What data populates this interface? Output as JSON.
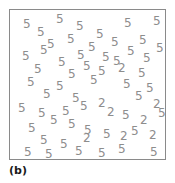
{
  "figure": {
    "label": "(b)",
    "border_color": "#8a8a8a",
    "background_color": "#ffffff",
    "glyph_color": "#8d8d8d",
    "frame": {
      "x": 9,
      "y": 9,
      "width": 157,
      "height": 151
    }
  },
  "chart_data": {
    "type": "scatter",
    "title": "(b)",
    "subtitle": "",
    "xlabel": "",
    "ylabel": "",
    "xlim": [
      0,
      157
    ],
    "ylim": [
      0,
      151
    ],
    "grid": false,
    "legend": "none",
    "counts": {
      "5": 51,
      "2": 9,
      "total": 60
    },
    "categories": [
      "5",
      "2"
    ],
    "values": [
      51,
      9
    ],
    "points": [
      {
        "label": "5",
        "x": 13,
        "y": 8,
        "rot": 0
      },
      {
        "label": "5",
        "x": 27,
        "y": 16,
        "rot": 0
      },
      {
        "label": "5",
        "x": 46,
        "y": 3,
        "rot": 0
      },
      {
        "label": "5",
        "x": 66,
        "y": 10,
        "rot": 0
      },
      {
        "label": "5",
        "x": 86,
        "y": 18,
        "rot": 0
      },
      {
        "label": "5",
        "x": 114,
        "y": 7,
        "rot": 0
      },
      {
        "label": "5",
        "x": 143,
        "y": 5,
        "rot": 0
      },
      {
        "label": "5",
        "x": 37,
        "y": 28,
        "rot": 0
      },
      {
        "label": "5",
        "x": 57,
        "y": 23,
        "rot": 0
      },
      {
        "label": "5",
        "x": 78,
        "y": 31,
        "rot": 0
      },
      {
        "label": "5",
        "x": 101,
        "y": 26,
        "rot": 0
      },
      {
        "label": "5",
        "x": 129,
        "y": 24,
        "rot": 0
      },
      {
        "label": "5",
        "x": 12,
        "y": 40,
        "rot": 0
      },
      {
        "label": "5",
        "x": 30,
        "y": 34,
        "rot": 0
      },
      {
        "label": "5",
        "x": 67,
        "y": 39,
        "rot": 0
      },
      {
        "label": "5",
        "x": 92,
        "y": 41,
        "rot": 0
      },
      {
        "label": "5",
        "x": 117,
        "y": 35,
        "rot": 0
      },
      {
        "label": "5",
        "x": 146,
        "y": 32,
        "rot": 0
      },
      {
        "label": "5",
        "x": 48,
        "y": 46,
        "rot": 0
      },
      {
        "label": "5",
        "x": 73,
        "y": 50,
        "rot": 0
      },
      {
        "label": "5",
        "x": 103,
        "y": 45,
        "rot": 0
      },
      {
        "label": "5",
        "x": 133,
        "y": 42,
        "rot": 0
      },
      {
        "label": "5",
        "x": 24,
        "y": 53,
        "rot": 0
      },
      {
        "label": "5",
        "x": 58,
        "y": 58,
        "rot": 0
      },
      {
        "label": "5",
        "x": 88,
        "y": 55,
        "rot": 0
      },
      {
        "label": "2",
        "x": 108,
        "y": 52,
        "rot": 0
      },
      {
        "label": "5",
        "x": 128,
        "y": 57,
        "rot": 0
      },
      {
        "label": "5",
        "x": 17,
        "y": 66,
        "rot": 0
      },
      {
        "label": "5",
        "x": 46,
        "y": 70,
        "rot": 0
      },
      {
        "label": "5",
        "x": 80,
        "y": 64,
        "rot": 0
      },
      {
        "label": "5",
        "x": 113,
        "y": 68,
        "rot": 0
      },
      {
        "label": "5",
        "x": 136,
        "y": 72,
        "rot": 0
      },
      {
        "label": "5",
        "x": 33,
        "y": 78,
        "rot": 0
      },
      {
        "label": "5",
        "x": 62,
        "y": 82,
        "rot": 0
      },
      {
        "label": "2",
        "x": 88,
        "y": 87,
        "rot": 0
      },
      {
        "label": "5",
        "x": 125,
        "y": 80,
        "rot": 0
      },
      {
        "label": "2",
        "x": 143,
        "y": 88,
        "rot": 0
      },
      {
        "label": "5",
        "x": 8,
        "y": 92,
        "rot": 0
      },
      {
        "label": "5",
        "x": 28,
        "y": 97,
        "rot": 0
      },
      {
        "label": "5",
        "x": 52,
        "y": 95,
        "rot": 0
      },
      {
        "label": "5",
        "x": 70,
        "y": 90,
        "rot": 0
      },
      {
        "label": "2",
        "x": 97,
        "y": 96,
        "rot": 0
      },
      {
        "label": "5",
        "x": 112,
        "y": 99,
        "rot": 0
      },
      {
        "label": "5",
        "x": 148,
        "y": 97,
        "rot": 0
      },
      {
        "label": "5",
        "x": 40,
        "y": 104,
        "rot": 0
      },
      {
        "label": "5",
        "x": 58,
        "y": 108,
        "rot": 0
      },
      {
        "label": "2",
        "x": 130,
        "y": 104,
        "rot": 0
      },
      {
        "label": "5",
        "x": 18,
        "y": 112,
        "rot": 0
      },
      {
        "label": "5",
        "x": 74,
        "y": 114,
        "rot": 0
      },
      {
        "label": "5",
        "x": 93,
        "y": 118,
        "rot": 0
      },
      {
        "label": "5",
        "x": 121,
        "y": 115,
        "rot": 0
      },
      {
        "label": "2",
        "x": 73,
        "y": 122,
        "rot": 0
      },
      {
        "label": "2",
        "x": 110,
        "y": 120,
        "rot": 0
      },
      {
        "label": "2",
        "x": 139,
        "y": 119,
        "rot": 0
      },
      {
        "label": "5",
        "x": 30,
        "y": 124,
        "rot": 0
      },
      {
        "label": "5",
        "x": 50,
        "y": 128,
        "rot": 0
      },
      {
        "label": "5",
        "x": 14,
        "y": 136,
        "rot": 0
      },
      {
        "label": "5",
        "x": 35,
        "y": 138,
        "rot": 0
      },
      {
        "label": "5",
        "x": 65,
        "y": 135,
        "rot": 0
      },
      {
        "label": "5",
        "x": 88,
        "y": 137,
        "rot": 0
      },
      {
        "label": "5",
        "x": 108,
        "y": 133,
        "rot": 0
      },
      {
        "label": "5",
        "x": 140,
        "y": 136,
        "rot": 0
      }
    ]
  }
}
